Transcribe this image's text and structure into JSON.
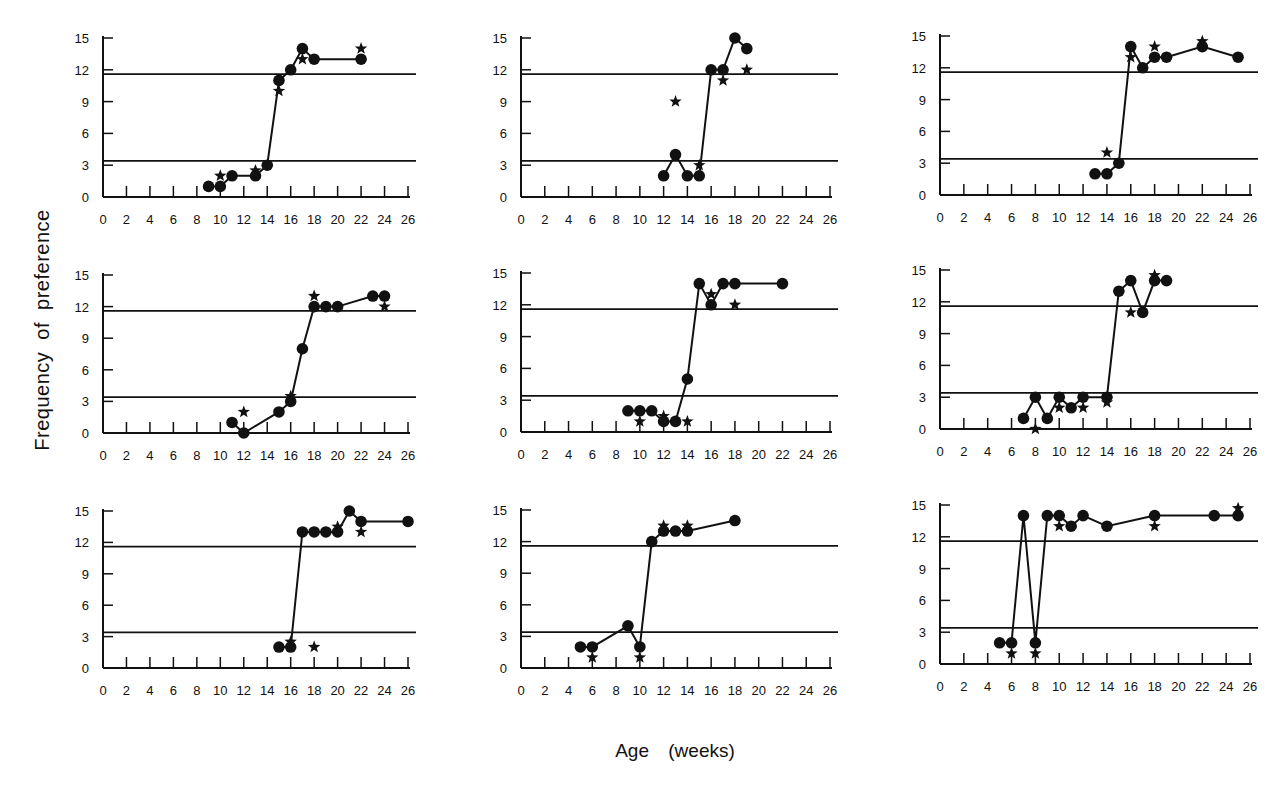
{
  "figure": {
    "ylabel": "Frequency of preference",
    "xlabel": "Age (weeks)"
  },
  "chart_data": {
    "type": "line",
    "title": "",
    "xlabel": "Age (weeks)",
    "ylabel": "Frequency of preference",
    "layout": "3x3 small multiples",
    "xlim": [
      0,
      26
    ],
    "ylim": [
      0,
      15
    ],
    "xticks": [
      0,
      2,
      4,
      6,
      8,
      10,
      12,
      14,
      16,
      18,
      20,
      22,
      24,
      26
    ],
    "yticks": [
      0,
      3,
      6,
      9,
      12,
      15
    ],
    "reference_lines_y": [
      3.4,
      11.6
    ],
    "grid": false,
    "legend": "none (circles = connected series, stars = secondary measure)",
    "panels": [
      {
        "id": 1,
        "circles": {
          "x": [
            9,
            10,
            11,
            13,
            14,
            15,
            16,
            17,
            18,
            22
          ],
          "y": [
            1,
            1,
            2,
            2,
            3,
            11,
            12,
            14,
            13,
            13
          ]
        },
        "stars": {
          "x": [
            10,
            13,
            15,
            17,
            22
          ],
          "y": [
            2,
            2.5,
            10,
            13,
            14
          ]
        }
      },
      {
        "id": 2,
        "circles": {
          "x": [
            12,
            13,
            14,
            15,
            16,
            17,
            18,
            19
          ],
          "y": [
            2,
            4,
            2,
            2,
            12,
            12,
            15,
            14
          ]
        },
        "stars": {
          "x": [
            13,
            15,
            17,
            19
          ],
          "y": [
            9,
            3,
            11,
            12
          ]
        }
      },
      {
        "id": 3,
        "circles": {
          "x": [
            13,
            14,
            15,
            16,
            17,
            18,
            19,
            22,
            25
          ],
          "y": [
            2,
            2,
            3,
            14,
            12,
            13,
            13,
            14,
            13
          ]
        },
        "stars": {
          "x": [
            14,
            16,
            18,
            22
          ],
          "y": [
            4,
            13,
            14,
            14.5
          ]
        }
      },
      {
        "id": 4,
        "circles": {
          "x": [
            11,
            12,
            15,
            16,
            17,
            18,
            19,
            20,
            23,
            24
          ],
          "y": [
            1,
            0,
            2,
            3,
            8,
            12,
            12,
            12,
            13,
            13
          ]
        },
        "stars": {
          "x": [
            12,
            16,
            18,
            24
          ],
          "y": [
            2,
            3.5,
            13,
            12
          ]
        }
      },
      {
        "id": 5,
        "circles": {
          "x": [
            9,
            10,
            11,
            12,
            13,
            14,
            15,
            16,
            17,
            18,
            22
          ],
          "y": [
            2,
            2,
            2,
            1,
            1,
            5,
            14,
            12,
            14,
            14,
            14
          ]
        },
        "stars": {
          "x": [
            10,
            12,
            14,
            16,
            18
          ],
          "y": [
            1,
            1.5,
            1,
            13,
            12
          ]
        }
      },
      {
        "id": 6,
        "circles": {
          "x": [
            7,
            8,
            9,
            10,
            11,
            12,
            14,
            15,
            16,
            17,
            18,
            19
          ],
          "y": [
            1,
            3,
            1,
            3,
            2,
            3,
            3,
            13,
            14,
            11,
            14,
            14
          ]
        },
        "stars": {
          "x": [
            8,
            10,
            12,
            14,
            16,
            18
          ],
          "y": [
            0,
            2,
            2,
            2.5,
            11,
            14.5
          ]
        }
      },
      {
        "id": 7,
        "circles": {
          "x": [
            15,
            16,
            17,
            18,
            19,
            20,
            21,
            22,
            26
          ],
          "y": [
            2,
            2,
            13,
            13,
            13,
            13,
            15,
            14,
            14
          ]
        },
        "stars": {
          "x": [
            16,
            18,
            20,
            22
          ],
          "y": [
            2.5,
            2,
            13.5,
            13
          ]
        }
      },
      {
        "id": 8,
        "circles": {
          "x": [
            5,
            6,
            9,
            10,
            11,
            12,
            13,
            14,
            18
          ],
          "y": [
            2,
            2,
            4,
            2,
            12,
            13,
            13,
            13,
            14
          ]
        },
        "stars": {
          "x": [
            6,
            10,
            12,
            14
          ],
          "y": [
            1,
            1,
            13.5,
            13.5
          ]
        }
      },
      {
        "id": 9,
        "circles": {
          "x": [
            5,
            6,
            7,
            8,
            9,
            10,
            11,
            12,
            14,
            18,
            23,
            25
          ],
          "y": [
            2,
            2,
            14,
            2,
            14,
            14,
            13,
            14,
            13,
            14,
            14,
            14
          ]
        },
        "stars": {
          "x": [
            6,
            8,
            10,
            18,
            25
          ],
          "y": [
            1,
            1,
            13,
            13,
            14.7
          ]
        }
      }
    ]
  },
  "panel_geometry": [
    {
      "x0": 103,
      "y0": 197,
      "x26": 408,
      "y15": 38
    },
    {
      "x0": 521,
      "y0": 197,
      "x26": 830,
      "y15": 38
    },
    {
      "x0": 940,
      "y0": 195,
      "x26": 1250,
      "y15": 36
    },
    {
      "x0": 103,
      "y0": 433,
      "x26": 408,
      "y15": 275
    },
    {
      "x0": 521,
      "y0": 432,
      "x26": 830,
      "y15": 273
    },
    {
      "x0": 940,
      "y0": 429,
      "x26": 1250,
      "y15": 270
    },
    {
      "x0": 103,
      "y0": 668,
      "x26": 408,
      "y15": 511
    },
    {
      "x0": 521,
      "y0": 668,
      "x26": 830,
      "y15": 510
    },
    {
      "x0": 940,
      "y0": 664,
      "x26": 1250,
      "y15": 505
    }
  ]
}
